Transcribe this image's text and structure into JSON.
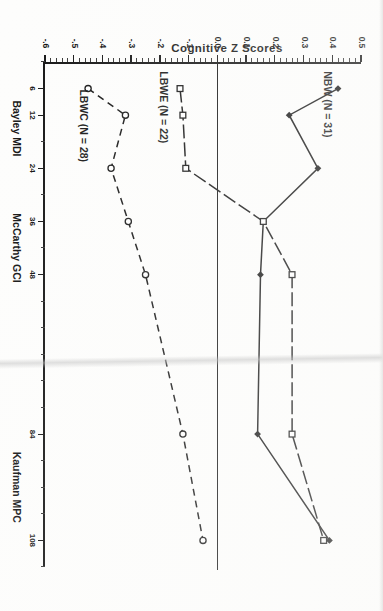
{
  "figure": {
    "y_axis_title": "Cognitive Z Scores",
    "x_axis_title": "AGE IN MONTHS",
    "group_labels": [
      {
        "label": "Bayley MDI",
        "at_month": 15
      },
      {
        "label": "McCarthy GCI",
        "at_month": 42
      },
      {
        "label": "Kaufman MPC",
        "at_month": 96
      }
    ],
    "series_labels": {
      "nbw": "NBW (N = 31)",
      "lbwe": "LBWE (N = 22)",
      "lbwc": "LBWC (N = 28)"
    }
  },
  "chart_data": {
    "type": "line",
    "title": "",
    "xlabel": "AGE IN MONTHS",
    "ylabel": "Cognitive Z Scores",
    "x": [
      6,
      12,
      24,
      36,
      48,
      84,
      108
    ],
    "xtick_labels": [
      "6",
      "12",
      "24",
      "36",
      "48",
      "84",
      "108"
    ],
    "xlim": [
      0,
      114
    ],
    "ylim": [
      -0.6,
      0.5
    ],
    "ytick_labels": [
      "0.5",
      "0.4",
      "0.3",
      "0.2",
      "0.1",
      "0.0",
      "-.1",
      "-.2",
      "-.3",
      "-.4",
      "-.5",
      "-.6"
    ],
    "ytick_values": [
      0.5,
      0.4,
      0.3,
      0.2,
      0.1,
      0.0,
      -0.1,
      -0.2,
      -0.3,
      -0.4,
      -0.5,
      -0.6
    ],
    "grid": false,
    "legend": "inline-labels",
    "reference_line": {
      "y": 0.0,
      "style": "solid"
    },
    "series": [
      {
        "name": "NBW (N = 31)",
        "n": 31,
        "line": "solid",
        "marker": "filled-diamond",
        "x": [
          6,
          12,
          24,
          36,
          48,
          84,
          108
        ],
        "values": [
          0.42,
          0.25,
          0.35,
          0.16,
          0.15,
          0.14,
          0.39
        ]
      },
      {
        "name": "LBWE (N = 22)",
        "n": 22,
        "line": "solid-long-dash",
        "marker": "open-square",
        "x": [
          6,
          12,
          24,
          36,
          48,
          84,
          108
        ],
        "values": [
          -0.13,
          -0.12,
          -0.11,
          0.16,
          0.26,
          0.26,
          0.37
        ]
      },
      {
        "name": "LBWC (N = 28)",
        "n": 28,
        "line": "dashed",
        "marker": "open-circle",
        "x": [
          6,
          12,
          24,
          36,
          48,
          84,
          108
        ],
        "values": [
          -0.45,
          -0.32,
          -0.37,
          -0.31,
          -0.25,
          -0.12,
          -0.05
        ]
      }
    ]
  }
}
